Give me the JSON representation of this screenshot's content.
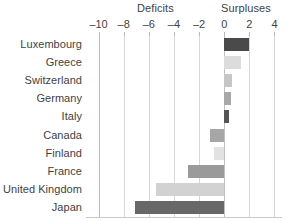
{
  "chart_data": {
    "type": "bar",
    "orientation": "horizontal",
    "title": "",
    "xlabel": "",
    "ylabel": "",
    "categories": [
      "Luxembourg",
      "Greece",
      "Switzerland",
      "Germany",
      "Italy",
      "Canada",
      "Finland",
      "France",
      "United Kingdom",
      "Japan"
    ],
    "values": [
      2.0,
      1.3,
      0.6,
      0.55,
      0.4,
      -1.1,
      -0.8,
      -2.9,
      -5.4,
      -7.1
    ],
    "bar_colors": [
      "#4a4a4a",
      "#dcdcdc",
      "#c6c6c6",
      "#a8a8a8",
      "#555555",
      "#a6a6a6",
      "#e2e2e2",
      "#9a9a9a",
      "#d2d2d2",
      "#686868"
    ],
    "xlim": [
      -11,
      4.6
    ],
    "xticks": [
      -10,
      -8,
      -6,
      -4,
      -2,
      0,
      2,
      4
    ],
    "xticklabels": [
      "–10",
      "–8",
      "–6",
      "–4",
      "–2",
      "0",
      "2",
      "4"
    ],
    "grid": true,
    "gridlines_at": [
      -10,
      -8,
      -6,
      -4,
      -2,
      0,
      2,
      4
    ],
    "legend": "none",
    "annotations": [
      {
        "text": "Deficits",
        "region": "negative-side-header"
      },
      {
        "text": "Surpluses",
        "region": "positive-side-header"
      }
    ]
  },
  "headers": {
    "deficits": "Deficits",
    "surpluses": "Surpluses"
  }
}
